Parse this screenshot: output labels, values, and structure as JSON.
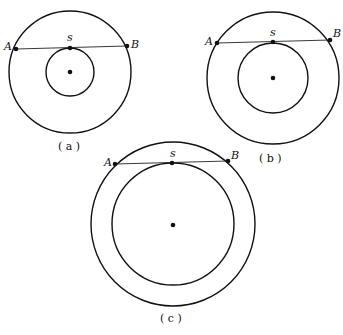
{
  "figures": [
    {
      "id": "a",
      "caption": "( a )",
      "center": [
        70,
        72
      ],
      "outer_r": 61,
      "inner_r": 24,
      "points": {
        "A": [
          16,
          49
        ],
        "s": [
          70,
          48
        ],
        "B": [
          127,
          46
        ]
      },
      "labels": {
        "A": "A",
        "s": "s",
        "B": "B"
      }
    },
    {
      "id": "b",
      "caption": "( b )",
      "center": [
        273,
        78
      ],
      "outer_r": 66,
      "inner_r": 35,
      "points": {
        "A": [
          217,
          43
        ],
        "s": [
          273,
          42
        ],
        "B": [
          330,
          40
        ]
      },
      "labels": {
        "A": "A",
        "s": "s",
        "B": "B"
      }
    },
    {
      "id": "c",
      "caption": "( c )",
      "center": [
        173,
        224
      ],
      "outer_r": 82,
      "inner_r": 61,
      "points": {
        "A": [
          115,
          164
        ],
        "s": [
          172,
          163
        ],
        "B": [
          228,
          161
        ]
      },
      "labels": {
        "A": "A",
        "s": "s",
        "B": "B"
      }
    }
  ]
}
